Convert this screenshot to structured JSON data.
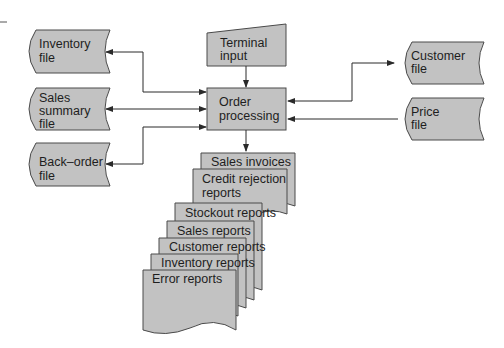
{
  "diagram": {
    "type": "system flowchart",
    "colors": {
      "shape_fill": "#c2c2c2",
      "stroke": "#4a4a4a",
      "text": "#1e1e1e",
      "background": "#ffffff"
    },
    "files_left": [
      {
        "id": "inventory",
        "lines": [
          "Inventory",
          "file"
        ],
        "flow": "bidirectional"
      },
      {
        "id": "sales-summary",
        "lines": [
          "Sales",
          "summary",
          "file"
        ],
        "flow": "bidirectional"
      },
      {
        "id": "back-order",
        "lines": [
          "Back–order",
          "file"
        ],
        "flow": "bidirectional"
      }
    ],
    "terminal_input": {
      "lines": [
        "Terminal",
        "input"
      ]
    },
    "process": {
      "lines": [
        "Order",
        "processing"
      ]
    },
    "files_right": [
      {
        "id": "customer",
        "lines": [
          "Customer",
          "file"
        ],
        "flow": "bidirectional"
      },
      {
        "id": "price",
        "lines": [
          "Price",
          "file"
        ],
        "flow": "input"
      }
    ],
    "reports": [
      {
        "lines": [
          "Sales invoices"
        ]
      },
      {
        "lines": [
          "Credit rejection",
          "reports"
        ]
      },
      {
        "lines": [
          "Stockout reports"
        ]
      },
      {
        "lines": [
          "Sales reports"
        ]
      },
      {
        "lines": [
          "Customer reports"
        ]
      },
      {
        "lines": [
          "Inventory reports"
        ]
      },
      {
        "lines": [
          "Error reports"
        ]
      }
    ]
  }
}
